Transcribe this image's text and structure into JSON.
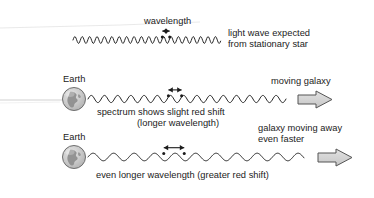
{
  "figure": {
    "title_implied": "Redshift of light from receding galaxies",
    "background_color": "#ffffff",
    "ink_color": "#1b1b1b",
    "earth_fill": "#cfcfcf",
    "earth_land": "#8a8a8a",
    "arrow_fill": "#d4d4d4",
    "arrow_stroke": "#4a4a4a",
    "artifact_line_color": "#d8d8d8"
  },
  "rows": [
    {
      "id": "stationary-star",
      "wavelength_label": "wavelength",
      "caption_lines": [
        "light wave expected",
        "from stationary star"
      ],
      "wave": {
        "x_start": 73,
        "x_end": 221,
        "baseline_y": 40,
        "amplitude": 3.4,
        "wavelength_px": 7.4,
        "marker_x": 166,
        "marker_span_px": 7.4
      },
      "has_earth": false,
      "has_galaxy_arrow": false
    },
    {
      "id": "slight-red-shift",
      "earth_label": "Earth",
      "caption_lines": [
        "spectrum shows slight red shift",
        "(longer wavelength)"
      ],
      "galaxy_label_lines": [
        "moving galaxy"
      ],
      "wave": {
        "x_start": 88,
        "x_end": 286,
        "baseline_y": 99,
        "amplitude": 3.6,
        "wavelength_px": 13.2,
        "marker_x": 175,
        "marker_span_px": 13.2
      },
      "earth": {
        "cx": 74,
        "cy": 99,
        "r": 11.5
      },
      "arrow": {
        "x": 298,
        "y": 91,
        "w": 34,
        "h": 17
      },
      "has_earth": true,
      "has_galaxy_arrow": true
    },
    {
      "id": "greater-red-shift",
      "earth_label": "Earth",
      "caption_lines": [
        "even longer wavelength (greater red shift)"
      ],
      "galaxy_label_lines": [
        "galaxy moving away",
        "even faster"
      ],
      "wave": {
        "x_start": 88,
        "x_end": 304,
        "baseline_y": 157,
        "amplitude": 3.8,
        "wavelength_px": 20.5,
        "marker_x": 174,
        "marker_span_px": 20.5
      },
      "earth": {
        "cx": 74,
        "cy": 157,
        "r": 11.5
      },
      "arrow": {
        "x": 318,
        "y": 149,
        "w": 34,
        "h": 17
      },
      "has_earth": true,
      "has_galaxy_arrow": true
    }
  ],
  "labels": {
    "wavelength": "wavelength",
    "light_wave_expected": "light wave expected",
    "from_stationary_star": "from stationary star",
    "earth_top": "Earth",
    "earth_bottom": "Earth",
    "spectrum_shows_slight_red_shift": "spectrum shows slight red shift",
    "longer_wavelength": "(longer wavelength)",
    "moving_galaxy": "moving galaxy",
    "galaxy_moving_away": "galaxy moving away",
    "even_faster": "even faster",
    "even_longer_wavelength": "even longer wavelength (greater red shift)"
  }
}
